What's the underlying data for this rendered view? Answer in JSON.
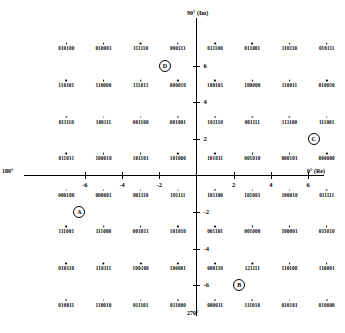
{
  "chart_data": {
    "type": "scatter",
    "title": "",
    "xlabel": "0° (Re)",
    "ylabel": "90° (Im)",
    "axis_labels": {
      "top": "90° (Im)",
      "right": "0° (Re)",
      "left": "180°",
      "bottom": "270°"
    },
    "xlim": [
      -8,
      8
    ],
    "ylim": [
      -8,
      8
    ],
    "grid": false,
    "legend": "none",
    "xticks": [
      -6,
      -4,
      -2,
      2,
      4,
      6
    ],
    "xtick_labels": [
      "-6",
      "-4",
      "-2",
      "2",
      "4",
      "6"
    ],
    "yticks": [
      6,
      4,
      2,
      -2,
      -4,
      -6
    ],
    "ytick_labels": [
      "6",
      "4",
      "2",
      "-2",
      "-4",
      "-6"
    ],
    "x": [
      -7,
      -5,
      -3,
      -1,
      1,
      3,
      5,
      7
    ],
    "y": [
      7,
      5,
      3,
      1,
      -1,
      -3,
      -5,
      -7
    ],
    "points": [
      {
        "x": -7,
        "y": 7,
        "label": "010100"
      },
      {
        "x": -5,
        "y": 7,
        "label": "010001"
      },
      {
        "x": -3,
        "y": 7,
        "label": "111110"
      },
      {
        "x": -1,
        "y": 7,
        "label": "000111"
      },
      {
        "x": 1,
        "y": 7,
        "label": "011100"
      },
      {
        "x": 3,
        "y": 7,
        "label": "011001"
      },
      {
        "x": 5,
        "y": 7,
        "label": "110110"
      },
      {
        "x": 7,
        "y": 7,
        "label": "010111"
      },
      {
        "x": -7,
        "y": 5,
        "label": "110101"
      },
      {
        "x": -5,
        "y": 5,
        "label": "110000"
      },
      {
        "x": -3,
        "y": 5,
        "label": "111011"
      },
      {
        "x": -1,
        "y": 5,
        "label": "000010"
      },
      {
        "x": 1,
        "y": 5,
        "label": "100101"
      },
      {
        "x": 3,
        "y": 5,
        "label": "100000"
      },
      {
        "x": 5,
        "y": 5,
        "label": "110011"
      },
      {
        "x": 7,
        "y": 5,
        "label": "010010"
      },
      {
        "x": -7,
        "y": 3,
        "label": "011110"
      },
      {
        "x": -5,
        "y": 3,
        "label": "100111"
      },
      {
        "x": -3,
        "y": 3,
        "label": "001100"
      },
      {
        "x": -1,
        "y": 3,
        "label": "001001"
      },
      {
        "x": 1,
        "y": 3,
        "label": "101110"
      },
      {
        "x": 3,
        "y": 3,
        "label": "001111"
      },
      {
        "x": 5,
        "y": 3,
        "label": "111100"
      },
      {
        "x": 7,
        "y": 3,
        "label": "111001"
      },
      {
        "x": -7,
        "y": 1,
        "label": "011011"
      },
      {
        "x": -5,
        "y": 1,
        "label": "100010"
      },
      {
        "x": -3,
        "y": 1,
        "label": "101101"
      },
      {
        "x": -1,
        "y": 1,
        "label": "101000"
      },
      {
        "x": 1,
        "y": 1,
        "label": "101011"
      },
      {
        "x": 3,
        "y": 1,
        "label": "001010"
      },
      {
        "x": 5,
        "y": 1,
        "label": "000101"
      },
      {
        "x": 7,
        "y": 1,
        "label": "000000"
      },
      {
        "x": -7,
        "y": -1,
        "label": "000100"
      },
      {
        "x": -5,
        "y": -1,
        "label": "000001"
      },
      {
        "x": -3,
        "y": -1,
        "label": "001110"
      },
      {
        "x": -1,
        "y": -1,
        "label": "101111"
      },
      {
        "x": 1,
        "y": -1,
        "label": "101100"
      },
      {
        "x": 3,
        "y": -1,
        "label": "101001"
      },
      {
        "x": 5,
        "y": -1,
        "label": "100010"
      },
      {
        "x": 7,
        "y": -1,
        "label": "011111"
      },
      {
        "x": -7,
        "y": -3,
        "label": "111001"
      },
      {
        "x": -5,
        "y": -3,
        "label": "111000"
      },
      {
        "x": -3,
        "y": -3,
        "label": "001011"
      },
      {
        "x": -1,
        "y": -3,
        "label": "101010"
      },
      {
        "x": 1,
        "y": -3,
        "label": "001101"
      },
      {
        "x": 3,
        "y": -3,
        "label": "001000"
      },
      {
        "x": 5,
        "y": -3,
        "label": "100001"
      },
      {
        "x": 7,
        "y": -3,
        "label": "011010"
      },
      {
        "x": -7,
        "y": -5,
        "label": "010110"
      },
      {
        "x": -5,
        "y": -5,
        "label": "110111"
      },
      {
        "x": -3,
        "y": -5,
        "label": "100100"
      },
      {
        "x": -1,
        "y": -5,
        "label": "100001"
      },
      {
        "x": 1,
        "y": -5,
        "label": "000110"
      },
      {
        "x": 3,
        "y": -5,
        "label": "121111"
      },
      {
        "x": 5,
        "y": -5,
        "label": "110100"
      },
      {
        "x": 7,
        "y": -5,
        "label": "110001"
      },
      {
        "x": -7,
        "y": -7,
        "label": "010011"
      },
      {
        "x": -5,
        "y": -7,
        "label": "110010"
      },
      {
        "x": -3,
        "y": -7,
        "label": "011101"
      },
      {
        "x": -1,
        "y": -7,
        "label": "011000"
      },
      {
        "x": 1,
        "y": -7,
        "label": "000011"
      },
      {
        "x": 3,
        "y": -7,
        "label": "111010"
      },
      {
        "x": 5,
        "y": -7,
        "label": "010101"
      },
      {
        "x": 7,
        "y": -7,
        "label": "010000"
      }
    ],
    "annotations": [
      {
        "label": "D",
        "x": -1.7,
        "y": 6.0
      },
      {
        "label": "C",
        "x": 6.3,
        "y": 2.0
      },
      {
        "label": "A",
        "x": -6.3,
        "y": -2.0
      },
      {
        "label": "B",
        "x": 2.3,
        "y": -6.0
      }
    ]
  }
}
